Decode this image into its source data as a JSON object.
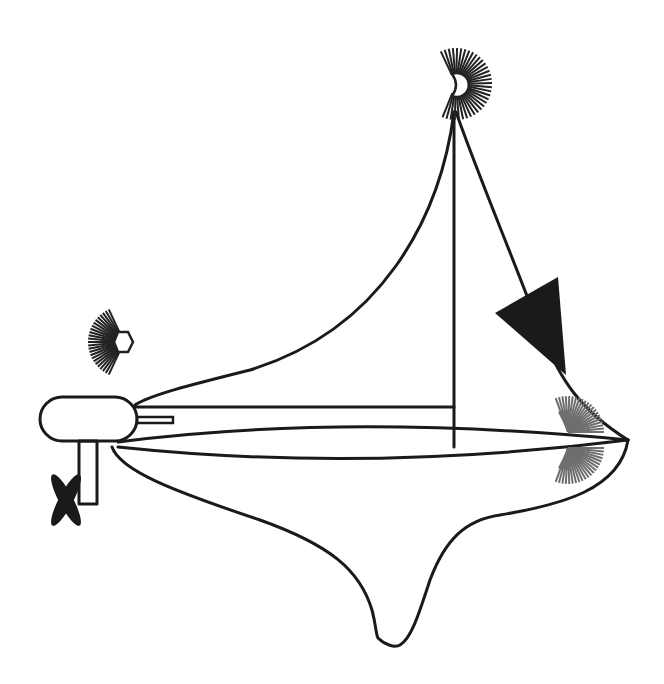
{
  "figure": {
    "subject": "sailboat navigation lights diagram",
    "colors": {
      "line": "#1a1a1a",
      "flag": "#1a1a1a",
      "masthead_light": "#222222",
      "stern_light": "#222222",
      "sidelight": "#6e6e6e",
      "background": "#ffffff"
    },
    "components": [
      {
        "id": "mast",
        "label": "mast"
      },
      {
        "id": "mainsail",
        "label": "mainsail"
      },
      {
        "id": "forestay",
        "label": "forestay"
      },
      {
        "id": "pennant",
        "label": "black triangular pennant"
      },
      {
        "id": "masthead-light",
        "label": "masthead light"
      },
      {
        "id": "stern-light",
        "label": "stern light"
      },
      {
        "id": "sidelight-upper",
        "label": "sidelight (port)"
      },
      {
        "id": "sidelight-lower",
        "label": "sidelight (starboard)"
      },
      {
        "id": "outboard-motor",
        "label": "outboard motor"
      },
      {
        "id": "propeller",
        "label": "propeller"
      },
      {
        "id": "boom",
        "label": "boom"
      },
      {
        "id": "hull",
        "label": "hull with keel"
      }
    ]
  }
}
